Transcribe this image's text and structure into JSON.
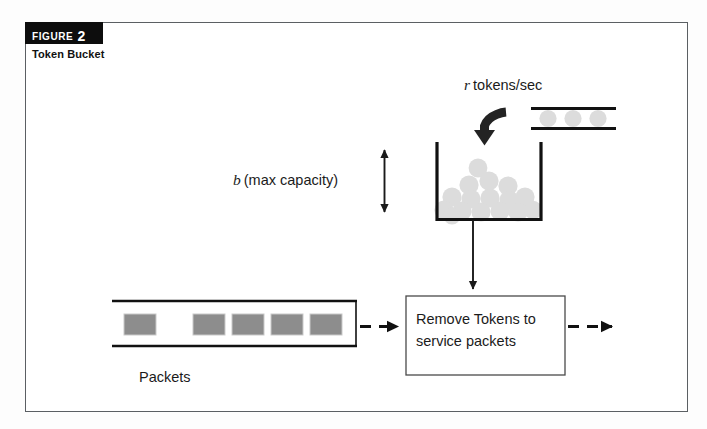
{
  "figure": {
    "badge_word": "FIGURE",
    "badge_number": "2",
    "subtitle": "Token Bucket",
    "badge_bg": "#0d0d0d",
    "badge_fg": "#ffffff",
    "frame_border": "#5b5f63",
    "page_bg": "#fdfdfd",
    "canvas_bg": "#ffffff"
  },
  "diagram": {
    "title": "Token Bucket",
    "token_rate_label": {
      "variable": "r",
      "text": "tokens/sec"
    },
    "capacity_label": {
      "variable": "b",
      "text": "(max capacity)"
    },
    "queue_label": "Packets",
    "service_box": {
      "line1": "Remove Tokens to",
      "line2": "service packets"
    },
    "counts": {
      "feed_pipe_tokens": 3,
      "bucket_tokens": 16,
      "queued_packets": 5
    },
    "colors": {
      "stroke": "#111111",
      "token_fill": "#dcdcdc",
      "packet_fill": "#8d8d8d",
      "packet_stroke": "#c9c9c9",
      "arrow": "#1a1a1a",
      "box_stroke": "#4a4a4a"
    },
    "elements": [
      "token-feed-pipe",
      "curved-inflow-arrow",
      "bucket",
      "capacity-double-arrow",
      "bucket-outflow-arrow",
      "packet-queue",
      "queue-to-service-dashed-arrow",
      "service-box",
      "service-output-dashed-arrow"
    ]
  }
}
